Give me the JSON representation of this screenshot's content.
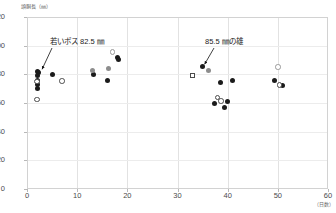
{
  "axes": {
    "y_title": "頭胴長（㎜）",
    "x_title": "（日数）",
    "y_ticks": [
      "0",
      "20",
      "40",
      "60",
      "80",
      "100",
      "120"
    ],
    "x_ticks": [
      "0",
      "10",
      "20",
      "30",
      "40",
      "50",
      "60"
    ]
  },
  "annotations": {
    "left": "若いボス 82.5 ㎜",
    "right": "85.5 ㎜の雄"
  },
  "chart_data": {
    "type": "scatter",
    "title": "",
    "xlabel": "（日数）",
    "ylabel": "頭胴長（㎜）",
    "xlim": [
      0,
      60
    ],
    "ylim": [
      0,
      120
    ],
    "xticks": [
      0,
      10,
      20,
      30,
      40,
      50,
      60
    ],
    "yticks": [
      0,
      20,
      40,
      60,
      80,
      100,
      120
    ],
    "grid": "vertical-major-and-light-horizontal",
    "legend": "none",
    "annotations": [
      {
        "text": "若いボス 82.5 ㎜",
        "points_to_x": 2.3,
        "points_to_y": 82.5
      },
      {
        "text": "85.5 ㎜の雄",
        "points_to_x": 35.0,
        "points_to_y": 85.5
      }
    ],
    "series": [
      {
        "name": "filled-black",
        "marker": "filled-circle",
        "color": "#1b1b1b",
        "points": [
          [
            2.0,
            82.0
          ],
          [
            2.2,
            81.0
          ],
          [
            2.0,
            79.0
          ],
          [
            2.1,
            76.0
          ],
          [
            2.0,
            73.0
          ],
          [
            2.1,
            70.0
          ],
          [
            5.0,
            80.0
          ],
          [
            13.2,
            80.0
          ],
          [
            16.0,
            76.0
          ],
          [
            18.0,
            92.0
          ],
          [
            18.2,
            90.5
          ],
          [
            35.0,
            85.5
          ],
          [
            38.6,
            74.5
          ],
          [
            41.0,
            76.0
          ],
          [
            37.3,
            59.8
          ],
          [
            40.0,
            61.2
          ],
          [
            39.3,
            57.0
          ],
          [
            49.3,
            76.0
          ],
          [
            51.0,
            72.5
          ]
        ]
      },
      {
        "name": "filled-gray",
        "marker": "filled-circle",
        "color": "#8d8d8d",
        "points": [
          [
            13.0,
            83.0
          ],
          [
            16.2,
            84.0
          ],
          [
            36.2,
            82.5
          ]
        ]
      },
      {
        "name": "open-circle",
        "marker": "open-circle",
        "color": "#4c4c4c",
        "points": [
          [
            2.0,
            75.0
          ],
          [
            2.0,
            62.5
          ],
          [
            7.0,
            75.5
          ],
          [
            38.0,
            64.0
          ],
          [
            38.7,
            61.5
          ],
          [
            50.3,
            72.5
          ]
        ]
      },
      {
        "name": "open-gray-circle",
        "marker": "open-circle",
        "color": "#9a9a9a",
        "points": [
          [
            17.0,
            95.5
          ],
          [
            50.0,
            85.0
          ]
        ]
      },
      {
        "name": "open-square",
        "marker": "open-square",
        "color": "#4c4c4c",
        "points": [
          [
            33.0,
            79.0
          ]
        ]
      }
    ]
  }
}
